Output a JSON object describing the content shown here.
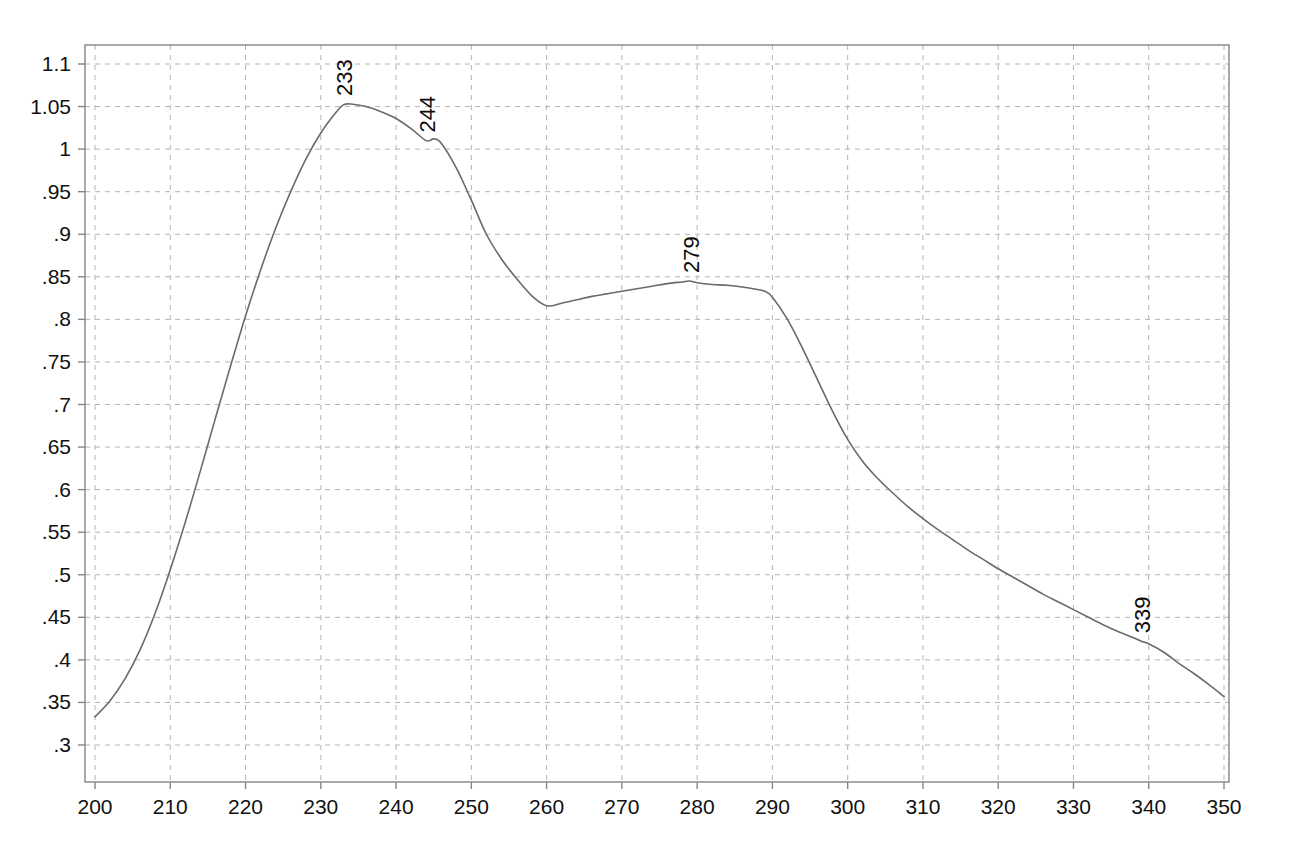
{
  "chart_data": {
    "type": "line",
    "title": "",
    "subtitle": "",
    "xlabel": "",
    "ylabel": "",
    "xlim": [
      200,
      350
    ],
    "ylim": [
      0.3,
      1.1
    ],
    "grid": true,
    "legend": "none",
    "background_color": "#ffffff",
    "line_color": "#6a6a6a",
    "grid_color": "#b4b4b4",
    "frame_color": "#858585",
    "annotation_color": "#0b0b0b",
    "xticks": [
      200,
      210,
      220,
      230,
      240,
      250,
      260,
      270,
      280,
      290,
      300,
      310,
      320,
      330,
      340,
      350
    ],
    "xtick_labels": [
      "200",
      "210",
      "220",
      "230",
      "240",
      "250",
      "260",
      "270",
      "280",
      "290",
      "300",
      "310",
      "320",
      "330",
      "340",
      "350"
    ],
    "yticks": [
      0.3,
      0.35,
      0.4,
      0.45,
      0.5,
      0.55,
      0.6,
      0.65,
      0.7,
      0.75,
      0.8,
      0.85,
      0.9,
      0.95,
      1.0,
      1.05,
      1.1
    ],
    "ytick_labels": [
      ".3",
      ".35",
      ".4",
      ".45",
      ".5",
      ".55",
      ".6",
      ".65",
      ".7",
      ".75",
      ".8",
      ".85",
      ".9",
      ".95",
      "1",
      "1.05",
      "1.1"
    ],
    "series": [
      {
        "name": "absorbance",
        "x": [
          200,
          202,
          204,
          206,
          208,
          210,
          212,
          214,
          216,
          218,
          220,
          222,
          224,
          226,
          228,
          230,
          232,
          233,
          234,
          236,
          238,
          240,
          242,
          244,
          245,
          246,
          248,
          250,
          252,
          254,
          256,
          258,
          260,
          262,
          264,
          266,
          268,
          270,
          272,
          274,
          276,
          278,
          279,
          280,
          282,
          284,
          286,
          288,
          289,
          290,
          292,
          294,
          296,
          298,
          300,
          302,
          304,
          306,
          308,
          310,
          312,
          314,
          316,
          318,
          320,
          322,
          324,
          326,
          328,
          330,
          332,
          334,
          336,
          338,
          339,
          340,
          342,
          344,
          346,
          348,
          350
        ],
        "y": [
          0.333,
          0.352,
          0.378,
          0.412,
          0.455,
          0.506,
          0.562,
          0.622,
          0.684,
          0.745,
          0.804,
          0.858,
          0.907,
          0.95,
          0.988,
          1.019,
          1.043,
          1.052,
          1.053,
          1.05,
          1.044,
          1.036,
          1.024,
          1.01,
          1.012,
          1.007,
          0.978,
          0.94,
          0.9,
          0.871,
          0.848,
          0.828,
          0.816,
          0.819,
          0.823,
          0.827,
          0.83,
          0.833,
          0.836,
          0.839,
          0.842,
          0.844,
          0.845,
          0.843,
          0.841,
          0.84,
          0.838,
          0.835,
          0.833,
          0.826,
          0.8,
          0.766,
          0.729,
          0.692,
          0.659,
          0.633,
          0.613,
          0.596,
          0.58,
          0.566,
          0.553,
          0.541,
          0.529,
          0.518,
          0.507,
          0.497,
          0.487,
          0.477,
          0.468,
          0.459,
          0.45,
          0.441,
          0.433,
          0.426,
          0.422,
          0.419,
          0.409,
          0.396,
          0.384,
          0.371,
          0.357
        ]
      }
    ],
    "annotations": [
      {
        "label": "233",
        "x": 233,
        "y": 1.053,
        "rotation": -90
      },
      {
        "label": "244",
        "x": 244,
        "y": 1.01,
        "rotation": -90
      },
      {
        "label": "279",
        "x": 279,
        "y": 0.845,
        "rotation": -90
      },
      {
        "label": "339",
        "x": 339,
        "y": 0.422,
        "rotation": -90
      }
    ]
  }
}
